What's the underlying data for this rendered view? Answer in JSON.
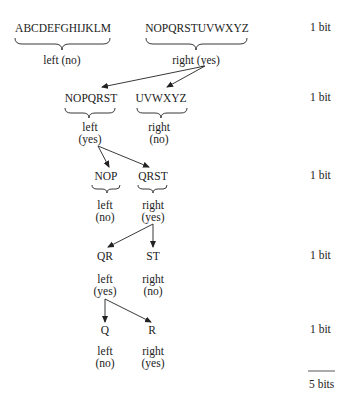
{
  "levels": [
    {
      "left_group": "ABCDEFGHIJKLM",
      "right_group": "NOPQRSTUVWXYZ",
      "left_label": "left (no)",
      "right_label": "right (yes)",
      "bits": "1 bit"
    },
    {
      "left_group": "NOPQRST",
      "right_group": "UVWXYZ",
      "left_label_1": "left",
      "left_label_2": "(yes)",
      "right_label_1": "right",
      "right_label_2": "(no)",
      "bits": "1 bit"
    },
    {
      "left_group": "NOP",
      "right_group": "QRST",
      "left_label_1": "left",
      "left_label_2": "(no)",
      "right_label_1": "right",
      "right_label_2": "(yes)",
      "bits": "1 bit"
    },
    {
      "left_group": "QR",
      "right_group": "ST",
      "left_label_1": "left",
      "left_label_2": "(yes)",
      "right_label_1": "right",
      "right_label_2": "(no)",
      "bits": "1 bit"
    },
    {
      "left_group": "Q",
      "right_group": "R",
      "left_label_1": "left",
      "left_label_2": "(no)",
      "right_label_1": "right",
      "right_label_2": "(yes)",
      "bits": "1 bit"
    }
  ],
  "total": "5 bits"
}
